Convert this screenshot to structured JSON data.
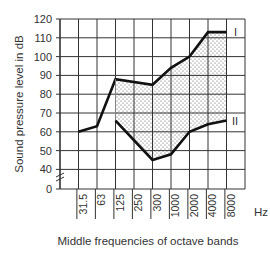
{
  "chart_data": {
    "type": "line",
    "title": "",
    "xlabel": "Middle frequencies of octave bands",
    "x_unit": "Hz",
    "ylabel": "Sound pressure level in dB",
    "y_tick_labels": [
      "120",
      "110",
      "100",
      "90",
      "80",
      "70",
      "60",
      "50",
      "40",
      "0"
    ],
    "y_axis_break": true,
    "ylim": [
      40,
      120
    ],
    "categories": [
      "31.5",
      "63",
      "125",
      "250",
      "300",
      "1000",
      "2000",
      "4000",
      "8000"
    ],
    "grid": true,
    "series": [
      {
        "name": "I",
        "points": [
          {
            "x": "31.5",
            "y": 60
          },
          {
            "x": "63",
            "y": 63
          },
          {
            "x": "125",
            "y": 88
          },
          {
            "x": "300",
            "y": 85
          },
          {
            "x": "1000",
            "y": 94
          },
          {
            "x": "2000",
            "y": 100
          },
          {
            "x": "4000",
            "y": 113
          },
          {
            "x": "8000",
            "y": 113
          }
        ]
      },
      {
        "name": "II",
        "points": [
          {
            "x": "125",
            "y": 66
          },
          {
            "x": "300",
            "y": 45
          },
          {
            "x": "1000",
            "y": 48
          },
          {
            "x": "2000",
            "y": 60
          },
          {
            "x": "4000",
            "y": 64
          },
          {
            "x": "8000",
            "y": 66
          }
        ]
      }
    ],
    "shaded_region": "between curve I and curve II (dotted fill), from 125 Hz to 8000 Hz",
    "legend": "curve labels I and II placed at right edge of plot",
    "colors": {
      "line": "#111111",
      "grid": "#333333",
      "fill_dots": "#555555"
    }
  },
  "labels": {
    "curve_upper": "I",
    "curve_lower": "II",
    "x_unit": "Hz",
    "x_title": "Middle frequencies of octave bands",
    "y_title": "Sound pressure level in dB"
  }
}
